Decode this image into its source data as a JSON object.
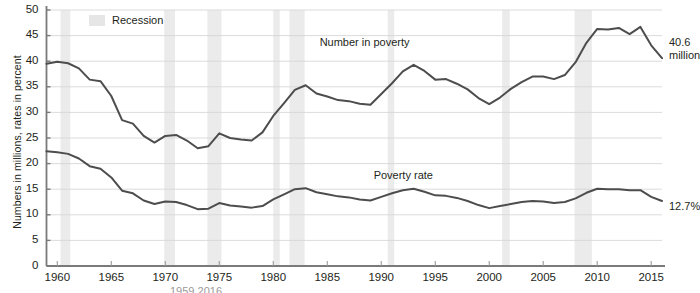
{
  "chart_data": {
    "type": "line",
    "title": "",
    "xlabel": "",
    "ylabel": "Numbers in millions, rates in percent",
    "xlim": [
      1959,
      2016
    ],
    "ylim": [
      0,
      50
    ],
    "grid": true,
    "legend_position": "top-left",
    "y_ticks": [
      0,
      5,
      10,
      15,
      20,
      25,
      30,
      35,
      40,
      45,
      50
    ],
    "x_ticks": [
      1960,
      1965,
      1970,
      1975,
      1980,
      1985,
      1990,
      1995,
      2000,
      2005,
      2010,
      2015
    ],
    "x": [
      1959,
      1960,
      1961,
      1962,
      1963,
      1964,
      1965,
      1966,
      1967,
      1968,
      1969,
      1970,
      1971,
      1972,
      1973,
      1974,
      1975,
      1976,
      1977,
      1978,
      1979,
      1980,
      1981,
      1982,
      1983,
      1984,
      1985,
      1986,
      1987,
      1988,
      1989,
      1990,
      1991,
      1992,
      1993,
      1994,
      1995,
      1996,
      1997,
      1998,
      1999,
      2000,
      2001,
      2002,
      2003,
      2004,
      2005,
      2006,
      2007,
      2008,
      2009,
      2010,
      2011,
      2012,
      2013,
      2014,
      2015,
      2016
    ],
    "series": [
      {
        "name": "Number in poverty",
        "unit": "millions",
        "color": "#4d4d4d",
        "label_x": 1988,
        "label_y": 43.5,
        "endpoint_label": "40.6\nmillion",
        "values": [
          39.5,
          39.9,
          39.6,
          38.6,
          36.4,
          36.1,
          33.2,
          28.5,
          27.8,
          25.4,
          24.1,
          25.4,
          25.6,
          24.5,
          23.0,
          23.4,
          25.9,
          25.0,
          24.7,
          24.5,
          26.1,
          29.3,
          31.8,
          34.4,
          35.3,
          33.7,
          33.1,
          32.4,
          32.2,
          31.7,
          31.5,
          33.6,
          35.7,
          38.0,
          39.3,
          38.1,
          36.4,
          36.5,
          35.6,
          34.5,
          32.8,
          31.6,
          32.9,
          34.6,
          35.9,
          37.0,
          37.0,
          36.5,
          37.3,
          39.8,
          43.6,
          46.3,
          46.2,
          46.5,
          45.3,
          46.7,
          43.1,
          40.6
        ]
      },
      {
        "name": "Poverty rate",
        "unit": "percent",
        "color": "#4d4d4d",
        "label_x": 1993,
        "label_y": 17.6,
        "endpoint_label": "12.7%",
        "values": [
          22.4,
          22.2,
          21.9,
          21.0,
          19.5,
          19.0,
          17.3,
          14.7,
          14.2,
          12.8,
          12.1,
          12.6,
          12.5,
          11.9,
          11.1,
          11.2,
          12.3,
          11.8,
          11.6,
          11.4,
          11.7,
          13.0,
          14.0,
          15.0,
          15.2,
          14.4,
          14.0,
          13.6,
          13.4,
          13.0,
          12.8,
          13.5,
          14.2,
          14.8,
          15.1,
          14.5,
          13.8,
          13.7,
          13.3,
          12.7,
          11.9,
          11.3,
          11.7,
          12.1,
          12.5,
          12.7,
          12.6,
          12.3,
          12.5,
          13.2,
          14.3,
          15.1,
          15.0,
          15.0,
          14.8,
          14.8,
          13.5,
          12.7
        ]
      }
    ],
    "recessions": [
      {
        "start": 1960.3,
        "end": 1961.2
      },
      {
        "start": 1969.9,
        "end": 1970.9
      },
      {
        "start": 1973.9,
        "end": 1975.2
      },
      {
        "start": 1980.0,
        "end": 1980.6
      },
      {
        "start": 1981.5,
        "end": 1982.9
      },
      {
        "start": 1990.6,
        "end": 1991.2
      },
      {
        "start": 2001.2,
        "end": 2001.9
      },
      {
        "start": 2007.9,
        "end": 2009.5
      }
    ],
    "recession_color": "#ebebeb"
  },
  "legend": {
    "swatch_name": "recession-swatch",
    "label": "Recession"
  },
  "caption": {
    "text": "1959 2016"
  }
}
